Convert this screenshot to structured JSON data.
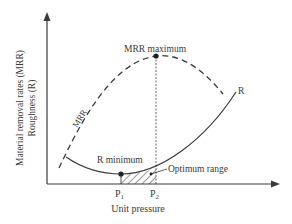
{
  "diagram": {
    "type": "conceptual-plot",
    "axes": {
      "x_label": "Unit pressure",
      "y_label_line1": "Material removal rates (MRR)",
      "y_label_line2": "Roughness (R)"
    },
    "curves": [
      {
        "name": "MRR",
        "style": "dashed",
        "label": "MRR"
      },
      {
        "name": "R",
        "style": "solid",
        "label": "R"
      }
    ],
    "annotations": {
      "mrr_max": "MRR maximum",
      "r_min": "R minimum",
      "optimum": "Optimum range"
    },
    "ticks": {
      "p1": "P",
      "p1_sub": "1",
      "p2": "P",
      "p2_sub": "2"
    },
    "colors": {
      "line": "#3a3a3a",
      "background": "#ffffff"
    }
  }
}
